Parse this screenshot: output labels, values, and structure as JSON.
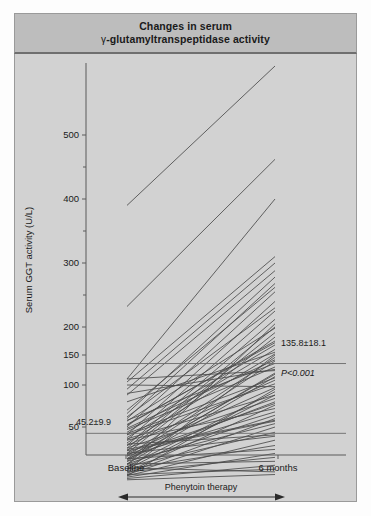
{
  "figure": {
    "title_line1": "Changes in serum",
    "title_gamma": "γ",
    "title_line2": "-glutamyltranspeptidase activity"
  },
  "chart_data": {
    "type": "line",
    "title": "Changes in serum γ-glutamyltranspeptidase activity",
    "subtitle": "",
    "xlabel": "",
    "ylabel": "Serum GGT activity (U/L)",
    "categories": [
      "Baseline",
      "6 months"
    ],
    "x": [
      0,
      1
    ],
    "ylim": [
      0,
      560
    ],
    "grid": false,
    "legend_position": "none",
    "y_axis_note": "Non-linear (compressed above 200 U/L)",
    "yticks_major": [
      50,
      100,
      150,
      200,
      300,
      400,
      500
    ],
    "yticks_minor": [
      250,
      350,
      450
    ],
    "xtick_labels": [
      "Baseline",
      "6 months"
    ],
    "annotations": [
      {
        "name": "baseline-mean",
        "text": "45.2±9.9",
        "x": 0.02,
        "y": 58
      },
      {
        "name": "followup-mean",
        "text": "135.8±18.1",
        "x": 1.02,
        "y": 165
      },
      {
        "name": "p-value",
        "text": "P<0.001",
        "x": 1.02,
        "y": 118
      },
      {
        "name": "therapy-bracket",
        "text": "Phenytoin therapy"
      }
    ],
    "mean_reference_lines": [
      {
        "name": "baseline-mean-line",
        "value": 45.2
      },
      {
        "name": "followup-mean-line",
        "value": 135.8
      }
    ],
    "series": [
      {
        "name": "subject-01",
        "values": [
          390,
          560
        ]
      },
      {
        "name": "subject-02",
        "values": [
          232,
          462
        ]
      },
      {
        "name": "subject-03",
        "values": [
          110,
          400
        ]
      },
      {
        "name": "subject-04",
        "values": [
          105,
          310
        ]
      },
      {
        "name": "subject-05",
        "values": [
          95,
          300
        ]
      },
      {
        "name": "subject-06",
        "values": [
          88,
          288
        ]
      },
      {
        "name": "subject-07",
        "values": [
          66,
          278
        ]
      },
      {
        "name": "subject-08",
        "values": [
          60,
          268
        ]
      },
      {
        "name": "subject-09",
        "values": [
          50,
          255
        ]
      },
      {
        "name": "subject-10",
        "values": [
          44,
          240
        ]
      },
      {
        "name": "subject-11",
        "values": [
          40,
          225
        ]
      },
      {
        "name": "subject-12",
        "values": [
          36,
          212
        ]
      },
      {
        "name": "subject-13",
        "values": [
          34,
          200
        ]
      },
      {
        "name": "subject-14",
        "values": [
          32,
          190
        ]
      },
      {
        "name": "subject-15",
        "values": [
          30,
          182
        ]
      },
      {
        "name": "subject-16",
        "values": [
          52,
          175
        ]
      },
      {
        "name": "subject-17",
        "values": [
          46,
          168
        ]
      },
      {
        "name": "subject-18",
        "values": [
          42,
          160
        ]
      },
      {
        "name": "subject-19",
        "values": [
          38,
          152
        ]
      },
      {
        "name": "subject-20",
        "values": [
          28,
          146
        ]
      },
      {
        "name": "subject-21",
        "values": [
          26,
          140
        ]
      },
      {
        "name": "subject-22",
        "values": [
          58,
          136
        ]
      },
      {
        "name": "subject-23",
        "values": [
          48,
          130
        ]
      },
      {
        "name": "subject-24",
        "values": [
          110,
          124
        ]
      },
      {
        "name": "subject-25",
        "values": [
          24,
          120
        ]
      },
      {
        "name": "subject-26",
        "values": [
          22,
          114
        ]
      },
      {
        "name": "subject-27",
        "values": [
          36,
          108
        ]
      },
      {
        "name": "subject-28",
        "values": [
          44,
          102
        ]
      },
      {
        "name": "subject-29",
        "values": [
          30,
          97
        ]
      },
      {
        "name": "subject-30",
        "values": [
          20,
          92
        ]
      },
      {
        "name": "subject-31",
        "values": [
          18,
          88
        ]
      },
      {
        "name": "subject-32",
        "values": [
          34,
          84
        ]
      },
      {
        "name": "subject-33",
        "values": [
          26,
          80
        ]
      },
      {
        "name": "subject-34",
        "values": [
          16,
          76
        ]
      },
      {
        "name": "subject-35",
        "values": [
          40,
          72
        ]
      },
      {
        "name": "subject-36",
        "values": [
          28,
          68
        ]
      },
      {
        "name": "subject-37",
        "values": [
          22,
          64
        ]
      },
      {
        "name": "subject-38",
        "values": [
          15,
          60
        ]
      },
      {
        "name": "subject-39",
        "values": [
          32,
          57
        ]
      },
      {
        "name": "subject-40",
        "values": [
          24,
          54
        ]
      },
      {
        "name": "subject-41",
        "values": [
          14,
          50
        ]
      },
      {
        "name": "subject-42",
        "values": [
          20,
          46
        ]
      },
      {
        "name": "subject-43",
        "values": [
          30,
          43
        ]
      },
      {
        "name": "subject-44",
        "values": [
          13,
          40
        ]
      },
      {
        "name": "subject-45",
        "values": [
          18,
          36
        ]
      },
      {
        "name": "subject-46",
        "values": [
          26,
          33
        ]
      },
      {
        "name": "subject-47",
        "values": [
          12,
          30
        ]
      },
      {
        "name": "subject-48",
        "values": [
          16,
          27
        ]
      },
      {
        "name": "subject-49",
        "values": [
          22,
          24
        ]
      },
      {
        "name": "subject-50",
        "values": [
          11,
          21
        ]
      },
      {
        "name": "subject-51",
        "values": [
          14,
          18
        ]
      },
      {
        "name": "subject-52",
        "values": [
          19,
          16
        ]
      },
      {
        "name": "subject-53",
        "values": [
          10,
          14
        ]
      },
      {
        "name": "subject-54",
        "values": [
          13,
          95
        ]
      },
      {
        "name": "subject-55",
        "values": [
          17,
          150
        ]
      },
      {
        "name": "subject-56",
        "values": [
          21,
          205
        ]
      },
      {
        "name": "subject-57",
        "values": [
          25,
          118
        ]
      },
      {
        "name": "subject-58",
        "values": [
          29,
          78
        ]
      },
      {
        "name": "subject-59",
        "values": [
          33,
          58
        ]
      },
      {
        "name": "subject-60",
        "values": [
          37,
          44
        ]
      },
      {
        "name": "subject-61",
        "values": [
          41,
          88
        ]
      },
      {
        "name": "subject-62",
        "values": [
          45,
          112
        ]
      },
      {
        "name": "subject-63",
        "values": [
          49,
          142
        ]
      },
      {
        "name": "subject-64",
        "values": [
          53,
          172
        ]
      },
      {
        "name": "subject-65",
        "values": [
          57,
          198
        ]
      },
      {
        "name": "subject-66",
        "values": [
          62,
          230
        ]
      },
      {
        "name": "subject-67",
        "values": [
          70,
          262
        ]
      },
      {
        "name": "subject-68",
        "values": [
          80,
          155
        ]
      },
      {
        "name": "subject-69",
        "values": [
          90,
          126
        ]
      },
      {
        "name": "subject-70",
        "values": [
          100,
          98
        ]
      }
    ]
  }
}
